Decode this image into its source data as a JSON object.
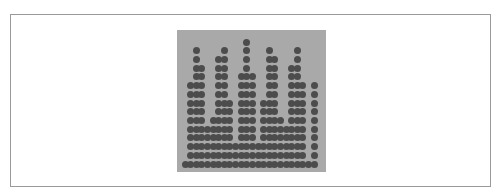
{
  "chart_data": {
    "type": "scatter",
    "title": "",
    "xlabel": "",
    "ylabel": "",
    "series": [
      {
        "name": "sampled wave",
        "function": "y = |sin(x)|",
        "periods_shown": 5.3,
        "x_range": [
          0,
          16.6
        ],
        "y_range": [
          0,
          1
        ],
        "arch_peak_positions_px": [
          200,
          222,
          245,
          268,
          292
        ],
        "trough_positions_px": [
          185,
          208,
          231,
          254,
          278,
          301
        ],
        "color": "#4c4c4c"
      }
    ],
    "grid": false,
    "legend": null,
    "background": "#a9a9a9"
  },
  "layout": {
    "plot_left": 177,
    "plot_top": 30,
    "plot_width": 149,
    "plot_height": 142,
    "samples": 150,
    "levels": 14,
    "dot_color": "#4c4c4c"
  }
}
